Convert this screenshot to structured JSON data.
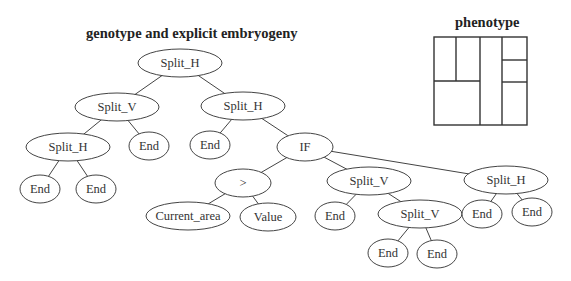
{
  "titles": {
    "genotype": "genotype and explicit embryogeny",
    "phenotype": "phenotype"
  },
  "tree": {
    "nodes": [
      {
        "id": "n0",
        "label": "Split_H",
        "x": 180,
        "y": 63,
        "rx": 42,
        "ry": 14
      },
      {
        "id": "n1",
        "label": "Split_V",
        "x": 117,
        "y": 107,
        "rx": 42,
        "ry": 14
      },
      {
        "id": "n2",
        "label": "Split_H",
        "x": 243,
        "y": 106,
        "rx": 42,
        "ry": 14
      },
      {
        "id": "n3",
        "label": "Split_H",
        "x": 68,
        "y": 147,
        "rx": 42,
        "ry": 14
      },
      {
        "id": "n4",
        "label": "End",
        "x": 149,
        "y": 146,
        "rx": 20,
        "ry": 14
      },
      {
        "id": "n5",
        "label": "End",
        "x": 210,
        "y": 145,
        "rx": 20,
        "ry": 14
      },
      {
        "id": "n6",
        "label": "IF",
        "x": 305,
        "y": 147,
        "rx": 28,
        "ry": 14
      },
      {
        "id": "n7",
        "label": "End",
        "x": 40,
        "y": 189,
        "rx": 20,
        "ry": 14
      },
      {
        "id": "n8",
        "label": "End",
        "x": 96,
        "y": 189,
        "rx": 20,
        "ry": 14
      },
      {
        "id": "n9",
        "label": ">",
        "x": 243,
        "y": 183,
        "rx": 28,
        "ry": 14
      },
      {
        "id": "n10",
        "label": "Split_V",
        "x": 369,
        "y": 181,
        "rx": 42,
        "ry": 14
      },
      {
        "id": "n11",
        "label": "Split_H",
        "x": 506,
        "y": 180,
        "rx": 42,
        "ry": 14
      },
      {
        "id": "n12",
        "label": "Current_area",
        "x": 188,
        "y": 216,
        "rx": 42,
        "ry": 14
      },
      {
        "id": "n13",
        "label": "Value",
        "x": 268,
        "y": 217,
        "rx": 28,
        "ry": 14
      },
      {
        "id": "n14",
        "label": "End",
        "x": 335,
        "y": 216,
        "rx": 20,
        "ry": 14
      },
      {
        "id": "n15",
        "label": "Split_V",
        "x": 420,
        "y": 214,
        "rx": 42,
        "ry": 14
      },
      {
        "id": "n16",
        "label": "End",
        "x": 482,
        "y": 214,
        "rx": 20,
        "ry": 14
      },
      {
        "id": "n17",
        "label": "End",
        "x": 532,
        "y": 212,
        "rx": 20,
        "ry": 14
      },
      {
        "id": "n18",
        "label": "End",
        "x": 388,
        "y": 253,
        "rx": 20,
        "ry": 14
      },
      {
        "id": "n19",
        "label": "End",
        "x": 437,
        "y": 254,
        "rx": 20,
        "ry": 14
      }
    ],
    "edges": [
      [
        "n0",
        "n1"
      ],
      [
        "n0",
        "n2"
      ],
      [
        "n1",
        "n3"
      ],
      [
        "n1",
        "n4"
      ],
      [
        "n2",
        "n5"
      ],
      [
        "n2",
        "n6"
      ],
      [
        "n3",
        "n7"
      ],
      [
        "n3",
        "n8"
      ],
      [
        "n6",
        "n9"
      ],
      [
        "n6",
        "n10"
      ],
      [
        "n6",
        "n11"
      ],
      [
        "n9",
        "n12"
      ],
      [
        "n9",
        "n13"
      ],
      [
        "n10",
        "n14"
      ],
      [
        "n10",
        "n15"
      ],
      [
        "n11",
        "n16"
      ],
      [
        "n11",
        "n17"
      ],
      [
        "n15",
        "n18"
      ],
      [
        "n15",
        "n19"
      ]
    ]
  },
  "phenotype": {
    "box": {
      "x": 434,
      "y": 37,
      "w": 93,
      "h": 88
    },
    "lines": [
      [
        456,
        37,
        456,
        81
      ],
      [
        434,
        81,
        480,
        81
      ],
      [
        480,
        37,
        480,
        125
      ],
      [
        502,
        37,
        502,
        125
      ],
      [
        502,
        60,
        527,
        60
      ],
      [
        502,
        82,
        527,
        82
      ]
    ]
  }
}
